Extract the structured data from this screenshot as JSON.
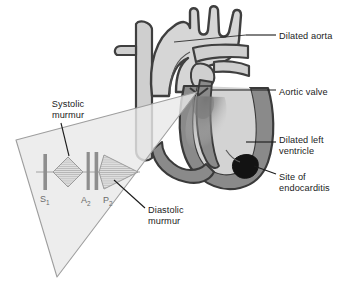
{
  "figure": {
    "title_fragment_left": "",
    "title_fragment_right": "",
    "kind": "medical-illustration"
  },
  "palette": {
    "outline": "#3a3a3a",
    "chamber_fill": "#d3d3d3",
    "muscle_fill": "#8a8a8a",
    "muscle_dark": "#6e6e6e",
    "vessel_fill": "#cfcfcf",
    "cone_fill": "#e9e9e9",
    "cone_stroke": "#9a9a9a",
    "bar_color": "#8e8e8e",
    "murmur_fill": "#d0d0d0",
    "murmur_stroke": "#9b9b9b",
    "leader": "#1b1b1b",
    "endocarditis": "#141414",
    "jet": "#7d7d7d",
    "sound_label": "#6b6b6b"
  },
  "labels": {
    "right": [
      {
        "id": "dilated-aorta",
        "text": "Dilated aorta",
        "x": 279,
        "y": 31
      },
      {
        "id": "aortic-valve",
        "text": "Aortic valve",
        "x": 279,
        "y": 87
      },
      {
        "id": "dilated-left-ventricle",
        "text": "Dilated left\nventricle",
        "x": 279,
        "y": 135
      },
      {
        "id": "site-of-endocarditis",
        "text": "Site of\nendocarditis",
        "x": 279,
        "y": 172
      }
    ],
    "left": [
      {
        "id": "systolic-murmur",
        "text": "Systolic\nmurmur",
        "x": 38,
        "y": 99
      },
      {
        "id": "diastolic-murmur",
        "text": "Diastolic\nmurmur",
        "x": 148,
        "y": 205
      }
    ]
  },
  "heart_sounds": [
    {
      "id": "s1",
      "base": "S",
      "sub": "1",
      "x": 40,
      "y": 196
    },
    {
      "id": "a2",
      "base": "A",
      "sub": "2",
      "x": 82,
      "y": 197
    },
    {
      "id": "p2",
      "base": "P",
      "sub": "2",
      "x": 104,
      "y": 197
    }
  ],
  "phonocardiogram": {
    "description": "Stethoscope cone containing heart sound bars and murmur envelopes",
    "sound_bars": [
      {
        "id": "s1-bar",
        "x": 45,
        "top": 155,
        "bottom": 190,
        "width": 3.4
      },
      {
        "id": "a2-bar",
        "x": 88,
        "top": 152,
        "bottom": 190,
        "width": 3.0
      },
      {
        "id": "p2-bar",
        "x": 96,
        "top": 152,
        "bottom": 190,
        "width": 3.4
      }
    ],
    "murmurs": [
      {
        "id": "systolic-murmur-envelope",
        "shape": "diamond",
        "x1": 53,
        "x2": 82,
        "cy": 172,
        "half_height": 15
      },
      {
        "id": "diastolic-murmur-envelope",
        "shape": "decrescendo-diamond",
        "x1": 99,
        "x2": 138,
        "cy": 172,
        "half_height": 17
      }
    ]
  },
  "anatomy": {
    "structures": [
      {
        "id": "aortic-arch",
        "label": "Dilated aorta"
      },
      {
        "id": "aortic-valve-region",
        "label": "Aortic valve"
      },
      {
        "id": "left-ventricle",
        "label": "Dilated left ventricle"
      },
      {
        "id": "endocarditis-vegetation",
        "label": "Site of endocarditis"
      },
      {
        "id": "regurgitant-jet",
        "label": "Regurgitant jet"
      },
      {
        "id": "superior-vena-cava",
        "label": "Superior vena cava"
      },
      {
        "id": "pulmonary-artery",
        "label": "Pulmonary artery"
      }
    ]
  }
}
